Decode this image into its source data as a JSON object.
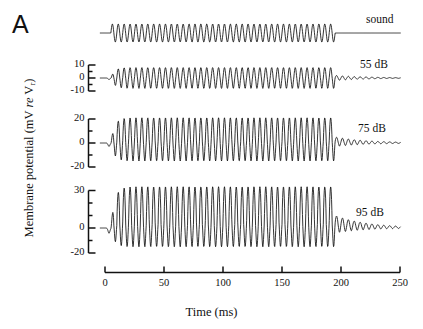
{
  "figure": {
    "panel_letter": "A",
    "xlabel": "Time (ms)",
    "ylabel_main": "Membrane potential (mV ",
    "ylabel_italic": "re",
    "ylabel_tail": " V",
    "ylabel_sub": "r",
    "ylabel_close": ")"
  },
  "chart_data": {
    "type": "line",
    "title": "",
    "xlabel": "Time (ms)",
    "ylabel": "Membrane potential (mV re Vr)",
    "xlim": [
      0,
      250
    ],
    "xticks": [
      0,
      50,
      100,
      150,
      200,
      250
    ],
    "xtick_labels": [
      "0",
      "50",
      "100",
      "150",
      "200",
      "250"
    ],
    "grid": false,
    "legend_position": "right-inline",
    "stimulus": {
      "onset_ms": 5,
      "offset_ms": 195,
      "carrier_frequency_hz": 200,
      "cycles": 38
    },
    "panels": [
      {
        "name": "sound",
        "label": "sound",
        "axis_visible": false,
        "yticks": [],
        "ytick_labels": [],
        "ylim": [
          -1,
          1
        ],
        "amplitude": 1.0,
        "description": "Constant-amplitude sinusoidal acoustic stimulus, flat before onset and after offset"
      },
      {
        "name": "response-55dB",
        "label": "55 dB",
        "axis_visible": true,
        "yticks": [
          10,
          0,
          -10
        ],
        "ytick_labels": [
          "10",
          "0",
          "-10"
        ],
        "minor_yticks": [
          5,
          -5
        ],
        "ylim": [
          -13,
          13
        ],
        "peak_positive_mv": 8,
        "peak_negative_mv": -8,
        "dc_offset_mv": 0,
        "offset_ringing_mv": 2,
        "description": "Small symmetric AC response following the stimulus envelope with brief post-offset ringing"
      },
      {
        "name": "response-75dB",
        "label": "75 dB",
        "axis_visible": true,
        "yticks": [
          20,
          0,
          -20
        ],
        "ytick_labels": [
          "20",
          "0",
          "-20"
        ],
        "minor_yticks": [
          10,
          -10
        ],
        "ylim": [
          -24,
          24
        ],
        "peak_positive_mv": 20,
        "peak_negative_mv": -16,
        "dc_offset_mv": 1,
        "offset_ringing_mv": 4,
        "description": "Larger asymmetric response with sharp positive peaks and rounded negative troughs"
      },
      {
        "name": "response-95dB",
        "label": "95 dB",
        "axis_visible": true,
        "yticks": [
          30,
          0,
          -20
        ],
        "ytick_labels": [
          "30",
          "0",
          "-20"
        ],
        "minor_yticks": [
          20,
          10,
          -10
        ],
        "ylim": [
          -24,
          34
        ],
        "peak_positive_mv": 30,
        "peak_negative_mv": -18,
        "dc_offset_mv": 3,
        "offset_ringing_mv": 7,
        "description": "Largest response, strongly rectified with tall narrow positive spikes and a sustained depolarizing offset ring"
      }
    ]
  }
}
